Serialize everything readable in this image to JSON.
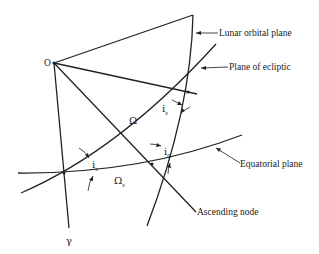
{
  "diagram": {
    "type": "celestial-geometry",
    "labels": {
      "origin": "O",
      "vernal_equinox": "γ",
      "lunar_orbital_plane": "Lunar orbital plane",
      "plane_of_ecliptic": "Plane of ecliptic",
      "equatorial_plane": "Equatorial plane",
      "ascending_node": "Ascending node",
      "omega": "Ω",
      "omega_epsilon_base": "Ω",
      "omega_epsilon_sub": "ε",
      "i_epsilon_base": "i",
      "i_epsilon_sub": "ε",
      "i_s_base": "i",
      "i_s_sub": "s",
      "i_0_base": "i",
      "i_0_sub": "0"
    }
  }
}
